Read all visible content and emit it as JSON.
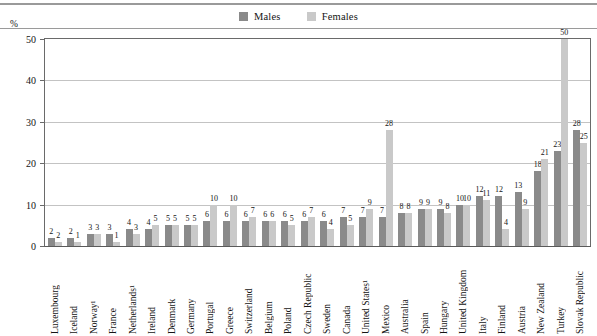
{
  "unit_label": "%",
  "legend": {
    "items": [
      {
        "label": "Males",
        "color": "#8a8a8a",
        "swatch_name": "males-swatch"
      },
      {
        "label": "Females",
        "color": "#c9c9c9",
        "swatch_name": "females-swatch"
      }
    ]
  },
  "chart_data": {
    "type": "bar",
    "title": "",
    "subtitle": "",
    "xlabel": "",
    "ylabel": "%",
    "ylim": [
      0,
      50
    ],
    "yticks": [
      0,
      10,
      20,
      30,
      40,
      50
    ],
    "ytick_labels": [
      "0",
      "10",
      "20",
      "30",
      "40",
      "50"
    ],
    "grid": true,
    "legend_position": "top-center",
    "categories": [
      "Luxembourg",
      "Iceland",
      "Norway¹",
      "France",
      "Netherlands¹",
      "Ireland",
      "Denmark",
      "Germany",
      "Portugal",
      "Greece",
      "Switzerland",
      "Belgium",
      "Poland",
      "Czech Republic",
      "Sweden",
      "Canada",
      "United States¹",
      "Mexico",
      "Australia",
      "Spain",
      "Hungary",
      "United Kingdom",
      "Italy",
      "Finland",
      "Austria",
      "New Zealand",
      "Turkey",
      "Slovak Republic"
    ],
    "series": [
      {
        "name": "Males",
        "color": "#8a8a8a",
        "values": [
          2,
          2,
          3,
          3,
          4,
          4,
          5,
          5,
          6,
          6,
          6,
          6,
          6,
          6,
          6,
          7,
          7,
          7,
          8,
          9,
          9,
          10,
          12,
          12,
          13,
          18,
          23,
          28
        ]
      },
      {
        "name": "Females",
        "color": "#c9c9c9",
        "values": [
          1,
          1,
          3,
          1,
          3,
          5,
          5,
          5,
          10,
          10,
          7,
          6,
          5,
          7,
          4,
          5,
          9,
          28,
          8,
          9,
          8,
          10,
          11,
          4,
          9,
          21,
          50,
          25
        ]
      }
    ],
    "data_labels": {
      "Males": [
        "2",
        "2",
        "3",
        "3",
        "4",
        "4",
        "5",
        "5",
        "6",
        "6",
        "6",
        "6",
        "6",
        "6",
        "6",
        "7",
        "7",
        "7",
        "8",
        "9",
        "9",
        "10",
        "12",
        "12",
        "13",
        "18",
        "23",
        "28"
      ],
      "Females": [
        "2",
        "1",
        "3",
        "1",
        "3",
        "5",
        "5",
        "5",
        "10",
        "10",
        "7",
        "6",
        "5",
        "7",
        "4",
        "5",
        "9",
        "28",
        "8",
        "9",
        "8",
        "10",
        "11",
        "4",
        "9",
        "21",
        "50",
        "25"
      ]
    }
  }
}
